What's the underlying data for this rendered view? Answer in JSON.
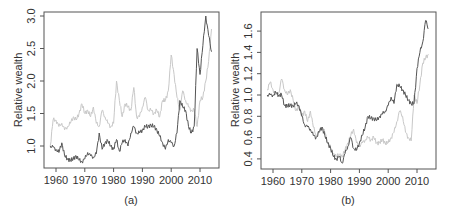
{
  "chart_data": [
    {
      "type": "line",
      "caption": "(a)",
      "xlabel": "",
      "ylabel": "Relative wealth",
      "xlim": [
        1956,
        2017
      ],
      "ylim": [
        0.65,
        3.05
      ],
      "xticks": [
        1960,
        1970,
        1980,
        1990,
        2000,
        2010
      ],
      "yticks": [
        1.0,
        1.5,
        2.0,
        2.5,
        3.0
      ],
      "ytick_labels": [
        "1.0",
        "1.5",
        "2.0",
        "2.5",
        "3.0"
      ],
      "grid": false,
      "legend": null,
      "series": [
        {
          "name": "light-series",
          "color": "#c8c8c8",
          "x": [
            1958,
            1959,
            1960,
            1961,
            1962,
            1963,
            1964,
            1965,
            1966,
            1967,
            1968,
            1969,
            1970,
            1971,
            1972,
            1973,
            1974,
            1975,
            1976,
            1977,
            1978,
            1979,
            1980,
            1981,
            1982,
            1983,
            1984,
            1985,
            1986,
            1987,
            1988,
            1989,
            1990,
            1991,
            1992,
            1993,
            1994,
            1995,
            1996,
            1997,
            1998,
            1999,
            2000,
            2001,
            2002,
            2003,
            2004,
            2005,
            2006,
            2007,
            2008,
            2009,
            2010,
            2011,
            2012,
            2013,
            2014
          ],
          "values": [
            1.0,
            1.4,
            1.4,
            1.3,
            1.35,
            1.25,
            1.3,
            1.35,
            1.45,
            1.4,
            1.5,
            1.65,
            1.5,
            1.55,
            1.45,
            1.6,
            1.35,
            1.3,
            1.55,
            1.45,
            1.35,
            1.3,
            1.35,
            2.0,
            1.7,
            1.45,
            1.65,
            1.6,
            1.55,
            1.9,
            1.45,
            1.45,
            1.6,
            1.75,
            1.55,
            1.55,
            1.5,
            1.55,
            1.45,
            1.7,
            1.7,
            1.85,
            2.4,
            2.1,
            1.75,
            1.55,
            1.85,
            1.7,
            1.6,
            1.55,
            1.55,
            1.3,
            1.7,
            1.75,
            2.0,
            2.3,
            2.8
          ]
        },
        {
          "name": "dark-series",
          "color": "#555555",
          "x": [
            1958,
            1959,
            1960,
            1961,
            1962,
            1963,
            1964,
            1965,
            1966,
            1967,
            1968,
            1969,
            1970,
            1971,
            1972,
            1973,
            1974,
            1975,
            1976,
            1977,
            1978,
            1979,
            1980,
            1981,
            1982,
            1983,
            1984,
            1985,
            1986,
            1987,
            1988,
            1989,
            1990,
            1991,
            1992,
            1993,
            1994,
            1995,
            1996,
            1997,
            1998,
            1999,
            2000,
            2001,
            2002,
            2003,
            2004,
            2005,
            2006,
            2007,
            2008,
            2009,
            2010,
            2011,
            2012,
            2013,
            2014
          ],
          "values": [
            1.0,
            0.98,
            0.95,
            0.9,
            1.05,
            0.85,
            0.8,
            0.78,
            0.8,
            0.85,
            0.78,
            0.76,
            0.8,
            0.9,
            0.85,
            0.83,
            0.88,
            1.2,
            0.95,
            1.05,
            1.08,
            1.0,
            0.95,
            1.1,
            0.92,
            1.05,
            1.1,
            1.0,
            1.2,
            1.3,
            1.2,
            1.2,
            1.25,
            1.3,
            1.3,
            1.32,
            1.3,
            1.25,
            1.15,
            1.05,
            0.95,
            1.1,
            1.05,
            1.0,
            1.2,
            1.7,
            1.6,
            1.55,
            1.3,
            1.2,
            1.3,
            2.5,
            2.1,
            2.55,
            3.0,
            2.7,
            2.45
          ]
        }
      ]
    },
    {
      "type": "line",
      "caption": "(b)",
      "xlabel": "",
      "ylabel": "Relative wealth",
      "xlim": [
        1956,
        2017
      ],
      "ylim": [
        0.33,
        1.75
      ],
      "xticks": [
        1960,
        1970,
        1980,
        1990,
        2000,
        2010
      ],
      "yticks": [
        0.4,
        0.6,
        0.8,
        1.0,
        1.2,
        1.4,
        1.6
      ],
      "ytick_labels": [
        "0.4",
        "0.6",
        "0.8",
        "1.0",
        "1.2",
        "1.4",
        "1.6"
      ],
      "grid": false,
      "legend": null,
      "series": [
        {
          "name": "light-series",
          "color": "#c8c8c8",
          "x": [
            1958,
            1959,
            1960,
            1961,
            1962,
            1963,
            1964,
            1965,
            1966,
            1967,
            1968,
            1969,
            1970,
            1971,
            1972,
            1973,
            1974,
            1975,
            1976,
            1977,
            1978,
            1979,
            1980,
            1981,
            1982,
            1983,
            1984,
            1985,
            1986,
            1987,
            1988,
            1989,
            1990,
            1991,
            1992,
            1993,
            1994,
            1995,
            1996,
            1997,
            1998,
            1999,
            2000,
            2001,
            2002,
            2003,
            2004,
            2005,
            2006,
            2007,
            2008,
            2009,
            2010,
            2011,
            2012,
            2013,
            2014
          ],
          "values": [
            1.05,
            1.12,
            1.05,
            1.0,
            1.02,
            1.15,
            1.05,
            1.0,
            1.05,
            0.95,
            0.85,
            0.9,
            0.8,
            0.85,
            0.75,
            0.85,
            0.7,
            0.62,
            0.65,
            0.7,
            0.65,
            0.55,
            0.5,
            0.45,
            0.42,
            0.44,
            0.42,
            0.48,
            0.55,
            0.62,
            0.68,
            0.55,
            0.52,
            0.55,
            0.58,
            0.6,
            0.58,
            0.6,
            0.55,
            0.55,
            0.58,
            0.55,
            0.55,
            0.6,
            0.65,
            0.75,
            0.85,
            0.8,
            0.65,
            0.6,
            0.57,
            1.0,
            0.92,
            1.1,
            1.3,
            1.35,
            1.38
          ]
        },
        {
          "name": "dark-series",
          "color": "#555555",
          "x": [
            1958,
            1959,
            1960,
            1961,
            1962,
            1963,
            1964,
            1965,
            1966,
            1967,
            1968,
            1969,
            1970,
            1971,
            1972,
            1973,
            1974,
            1975,
            1976,
            1977,
            1978,
            1979,
            1980,
            1981,
            1982,
            1983,
            1984,
            1985,
            1986,
            1987,
            1988,
            1989,
            1990,
            1991,
            1992,
            1993,
            1994,
            1995,
            1996,
            1997,
            1998,
            1999,
            2000,
            2001,
            2002,
            2003,
            2004,
            2005,
            2006,
            2007,
            2008,
            2009,
            2010,
            2011,
            2012,
            2013,
            2014
          ],
          "values": [
            1.0,
            1.0,
            1.0,
            1.02,
            1.0,
            1.0,
            0.9,
            0.9,
            0.9,
            0.9,
            0.92,
            0.9,
            0.8,
            0.72,
            0.7,
            0.68,
            0.62,
            0.6,
            0.65,
            0.7,
            0.62,
            0.55,
            0.5,
            0.42,
            0.4,
            0.42,
            0.36,
            0.45,
            0.52,
            0.6,
            0.5,
            0.48,
            0.55,
            0.62,
            0.7,
            0.8,
            0.78,
            0.78,
            0.76,
            0.8,
            0.82,
            0.85,
            0.9,
            0.98,
            0.92,
            1.1,
            1.08,
            1.05,
            1.0,
            0.95,
            0.92,
            0.92,
            1.25,
            1.4,
            1.5,
            1.7,
            1.62
          ]
        }
      ]
    }
  ]
}
